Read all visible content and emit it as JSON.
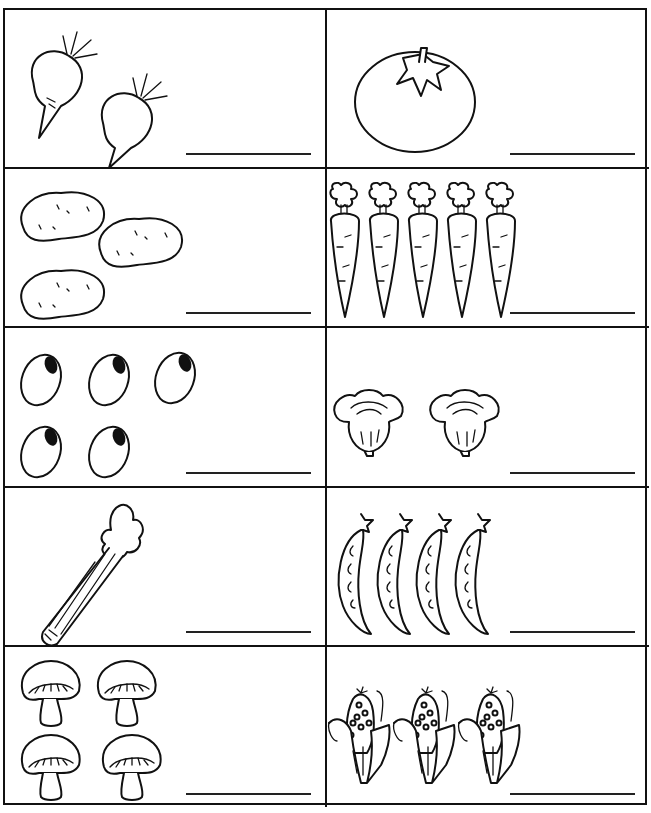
{
  "worksheet": {
    "type": "counting-vegetables",
    "cells": [
      {
        "id": "beets",
        "item": "beet",
        "count": 2,
        "answer": ""
      },
      {
        "id": "tomato",
        "item": "tomato",
        "count": 1,
        "answer": ""
      },
      {
        "id": "potatoes",
        "item": "potato",
        "count": 3,
        "answer": ""
      },
      {
        "id": "carrots",
        "item": "carrot",
        "count": 5,
        "answer": ""
      },
      {
        "id": "beans",
        "item": "bean",
        "count": 5,
        "answer": ""
      },
      {
        "id": "lettuce",
        "item": "lettuce",
        "count": 2,
        "answer": ""
      },
      {
        "id": "celery",
        "item": "celery",
        "count": 1,
        "answer": ""
      },
      {
        "id": "peas",
        "item": "pea-pod",
        "count": 4,
        "answer": ""
      },
      {
        "id": "mushrooms",
        "item": "mushroom",
        "count": 4,
        "answer": ""
      },
      {
        "id": "corn",
        "item": "corn",
        "count": 3,
        "answer": ""
      }
    ]
  }
}
